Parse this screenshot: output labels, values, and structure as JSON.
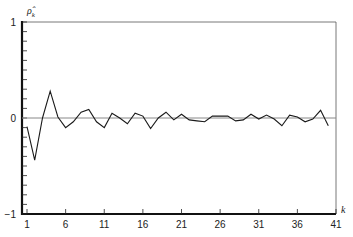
{
  "chart_data": {
    "type": "line",
    "title": "",
    "xlabel": "k",
    "ylabel": "ρ̂_k",
    "ylabel_main": "ρ̂",
    "ylabel_sub": "k",
    "xlim": [
      1,
      41
    ],
    "ylim": [
      -1,
      1
    ],
    "grid": false,
    "legend": null,
    "x_ticks": [
      1,
      6,
      11,
      16,
      21,
      26,
      31,
      36,
      41
    ],
    "x_tick_labels": [
      "1",
      "6",
      "11",
      "16",
      "21",
      "26",
      "31",
      "36",
      "41"
    ],
    "y_tick_labels": [
      "1",
      "0",
      "−1"
    ],
    "y_tick_values": [
      1,
      0,
      -1
    ],
    "y_minor_tick_step": 0.1,
    "zero_line": true,
    "series": [
      {
        "name": "sample autocorrelation",
        "x": [
          1,
          2,
          3,
          4,
          5,
          6,
          7,
          8,
          9,
          10,
          11,
          12,
          13,
          14,
          15,
          16,
          17,
          18,
          19,
          20,
          21,
          22,
          23,
          24,
          25,
          26,
          27,
          28,
          29,
          30,
          31,
          32,
          33,
          34,
          35,
          36,
          37,
          38,
          39,
          40
        ],
        "values": [
          -0.09,
          -0.44,
          0.0,
          0.28,
          0.01,
          -0.1,
          -0.04,
          0.06,
          0.09,
          -0.04,
          -0.1,
          0.05,
          0.0,
          -0.06,
          0.05,
          0.02,
          -0.11,
          0.0,
          0.06,
          -0.02,
          0.04,
          -0.02,
          -0.03,
          -0.04,
          0.02,
          0.02,
          0.02,
          -0.03,
          -0.02,
          0.04,
          -0.01,
          0.03,
          -0.01,
          -0.08,
          0.03,
          0.01,
          -0.04,
          -0.01,
          0.08,
          -0.08
        ]
      }
    ]
  }
}
